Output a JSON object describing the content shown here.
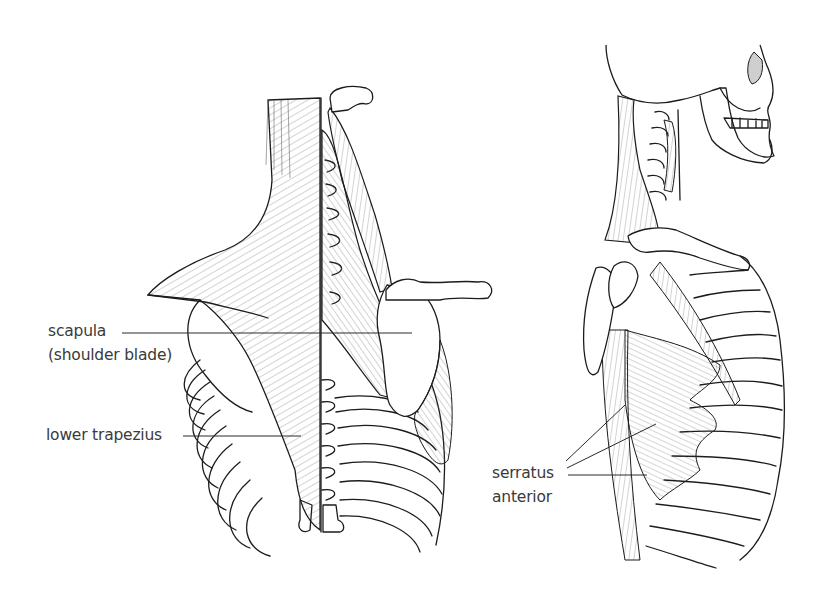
{
  "figure": {
    "colors": {
      "background": "#ffffff",
      "ink": "#1c1c1c",
      "label_text": "#3a3a3a"
    }
  },
  "left_view": {
    "name": "posterior view of upper back",
    "labels": [
      {
        "id": "scapula",
        "line1": "scapula",
        "line2": "(shoulder blade)"
      },
      {
        "id": "lower-trapezius",
        "line1": "lower trapezius"
      }
    ]
  },
  "right_view": {
    "name": "lateral view of neck, shoulder and rib cage",
    "labels": [
      {
        "id": "serratus-anterior",
        "line1": "serratus",
        "line2": "anterior"
      }
    ]
  }
}
